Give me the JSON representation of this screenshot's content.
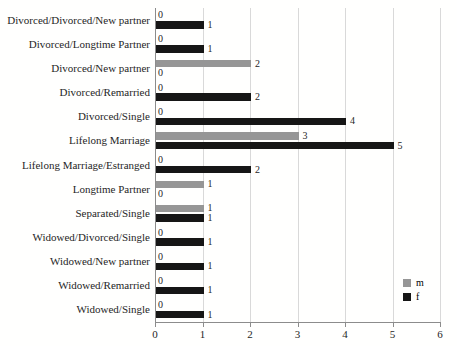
{
  "chart_data": {
    "type": "bar",
    "orientation": "horizontal",
    "title": "",
    "xlabel": "",
    "ylabel": "",
    "categories": [
      "Divorced/Divorced/New partner",
      "Divorced/Longtime Partner",
      "Divorced/New partner",
      "Divorced/Remarried",
      "Divorced/Single",
      "Lifelong Marriage",
      "Lifelong Marriage/Estranged",
      "Longtime Partner",
      "Separated/Single",
      "Widowed/Divorced/Single",
      "Widowed/New partner",
      "Widowed/Remarried",
      "Widowed/Single"
    ],
    "series": [
      {
        "name": "m",
        "color": "#969696",
        "values": [
          0,
          0,
          2,
          0,
          0,
          3,
          0,
          1,
          1,
          0,
          0,
          0,
          0
        ]
      },
      {
        "name": "f",
        "color": "#161616",
        "values": [
          1,
          1,
          0,
          2,
          4,
          5,
          2,
          0,
          1,
          1,
          1,
          1,
          1
        ]
      }
    ],
    "xlim": [
      0,
      6
    ],
    "xticks": [
      "0",
      "1",
      "2",
      "3",
      "4",
      "5",
      "6"
    ],
    "grid": true,
    "value_labels": true,
    "legend_position": "bottom-right",
    "colors": {
      "gridline": "#d9d9d9",
      "axis": "#8c8c8c",
      "text": "#262626"
    }
  }
}
